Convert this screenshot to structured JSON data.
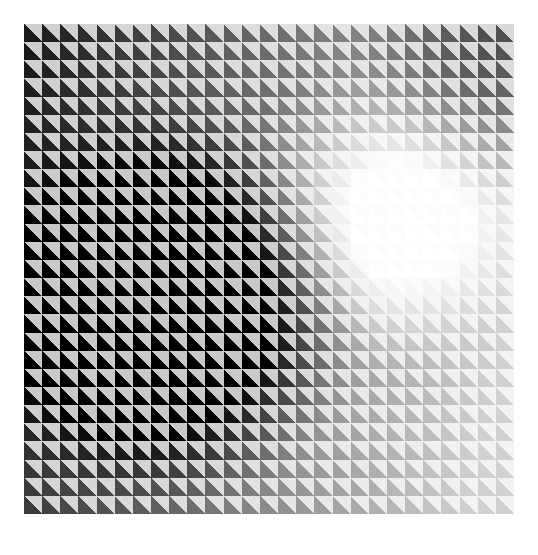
{
  "artwork": {
    "title": "Op Art Triangle Grid",
    "style_name": "vasarely-gradient-triangles",
    "canvas": {
      "width": 538,
      "height": 555,
      "background_color": "#ffffff"
    },
    "grid": {
      "origin_x": 24,
      "origin_y": 24,
      "width": 490,
      "height": 490,
      "columns": 27,
      "rows": 27,
      "cell_size": 18.1481,
      "cell_shape": "square-split-by-antidiagonal",
      "triangle_upper_right": "light",
      "triangle_lower_left": "dark",
      "gap": 0
    },
    "palette": {
      "darkest": "#000000",
      "lightest": "#ffffff",
      "paper": "#ffffff",
      "light_tint_min": "#d8d8d8",
      "mid_gray": "#808080"
    },
    "gradient_field": {
      "description": "Radial luminance field; dark core at left-of-center, bright lobe at right-of-center, secondary darkening toward the top-right and far-right edges.",
      "dark_core": {
        "col": 7.5,
        "row": 15.0,
        "radius": 12.0
      },
      "bright_lobe": {
        "col": 19.5,
        "row": 10.0,
        "radius": 9.5
      },
      "edge_shadow": {
        "col": 26.5,
        "row": 0.5,
        "radius": 10.0
      },
      "contrast": 1.0
    },
    "chart_data": {
      "type": "heatmap",
      "title": "Op Art Triangle Grid",
      "xlabel": "column",
      "ylabel": "row",
      "columns": 27,
      "rows": 27,
      "value_range": [
        0,
        1
      ],
      "value_meaning": "dark-triangle luminance, 0 = black, 1 = white",
      "legend": "none",
      "grid": false,
      "column_profile_row_14": [
        0.06,
        0.04,
        0.03,
        0.02,
        0.02,
        0.02,
        0.01,
        0.01,
        0.01,
        0.02,
        0.03,
        0.04,
        0.05,
        0.06,
        0.08,
        0.11,
        0.15,
        0.2,
        0.27,
        0.36,
        0.47,
        0.58,
        0.68,
        0.76,
        0.82,
        0.86,
        0.88
      ],
      "row_profile_col_7": [
        0.22,
        0.17,
        0.13,
        0.1,
        0.08,
        0.06,
        0.05,
        0.04,
        0.03,
        0.02,
        0.02,
        0.01,
        0.01,
        0.01,
        0.01,
        0.01,
        0.01,
        0.02,
        0.02,
        0.03,
        0.04,
        0.05,
        0.07,
        0.09,
        0.12,
        0.16,
        0.2
      ],
      "corner_values": {
        "top_left": 0.1,
        "top_right": 0.34,
        "bottom_left": 0.03,
        "bottom_right": 0.8,
        "center": 0.1
      }
    }
  }
}
